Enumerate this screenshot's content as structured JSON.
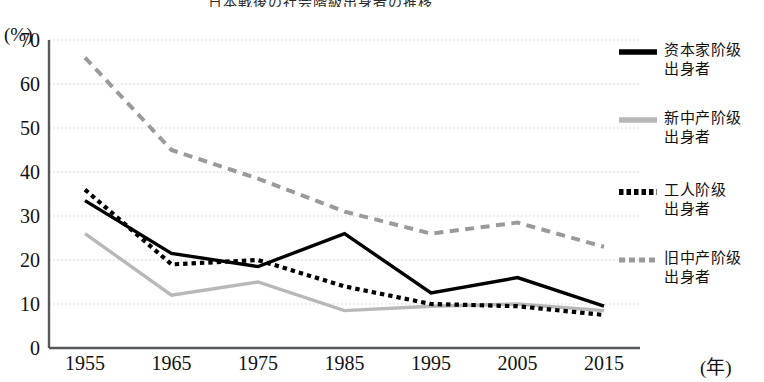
{
  "chart_data": {
    "type": "line",
    "title": "日本戦後の社会階級出身者の推移",
    "xlabel": "(年)",
    "ylabel": "(%)",
    "x": [
      1955,
      1965,
      1975,
      1985,
      1995,
      2005,
      2015
    ],
    "xticklabels": [
      "1955",
      "1965",
      "1975",
      "1985",
      "1995",
      "2005",
      "2015"
    ],
    "yticklabels": [
      "0",
      "10",
      "20",
      "30",
      "40",
      "50",
      "60",
      "70"
    ],
    "yticks": [
      0,
      10,
      20,
      30,
      40,
      50,
      60,
      70
    ],
    "ylim": [
      0,
      70
    ],
    "grid": "horizontal-dotted",
    "legend_position": "right",
    "series": [
      {
        "name": "资本家阶级\n出身者",
        "style": "solid",
        "color": "#000000",
        "width": 3.4,
        "values": [
          33.5,
          21.5,
          18.5,
          26.0,
          12.5,
          16.0,
          9.5
        ]
      },
      {
        "name": "新中产阶级\n出身者",
        "style": "solid",
        "color": "#b8b8b8",
        "width": 3.4,
        "values": [
          26.0,
          12.0,
          15.0,
          8.5,
          9.5,
          10.0,
          8.5
        ]
      },
      {
        "name": "工人阶级\n出身者",
        "style": "dotted",
        "color": "#000000",
        "width": 4.2,
        "values": [
          36.0,
          19.0,
          20.0,
          14.0,
          10.0,
          9.5,
          7.5
        ]
      },
      {
        "name": "旧中产阶级\n出身者",
        "style": "dashed",
        "color": "#9a9a9a",
        "width": 4.0,
        "values": [
          66.0,
          45.0,
          38.5,
          31.0,
          26.0,
          28.5,
          23.0
        ]
      }
    ]
  }
}
